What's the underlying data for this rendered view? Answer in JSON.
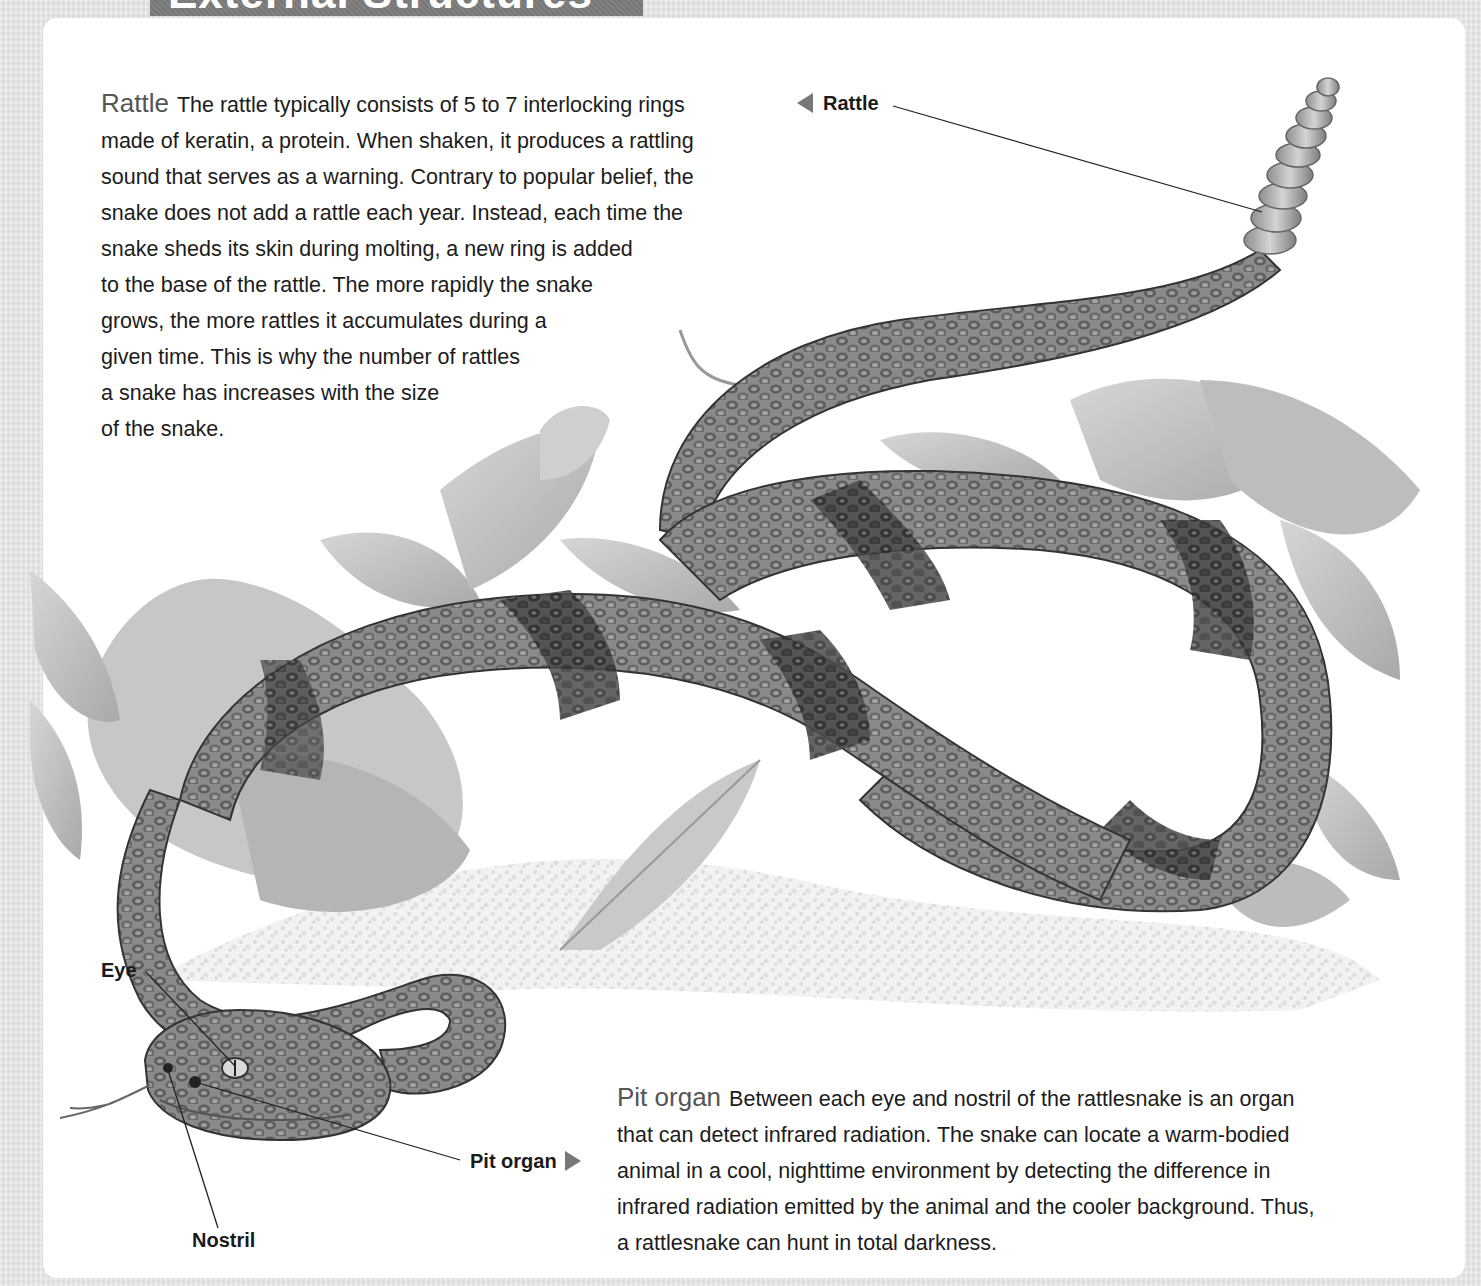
{
  "header": {
    "title": "External Structures",
    "title_tab_color": "#7b7b7b"
  },
  "sections": {
    "rattle": {
      "heading": "Rattle",
      "lines": [
        "The rattle typically consists of 5 to 7 interlocking rings",
        "made of keratin, a protein. When shaken, it produces a rattling",
        "sound that serves as a warning. Contrary to popular belief, the",
        "snake does not add a rattle each year. Instead, each time the",
        "snake sheds its skin during molting, a new ring is added",
        "to the base of the rattle. The more rapidly the snake",
        "grows, the more rattles it accumulates during a",
        "given time. This is why the number of rattles",
        "a snake has increases with the size",
        "of the snake."
      ]
    },
    "pit_organ": {
      "heading": "Pit organ",
      "lines": [
        "Between each eye and nostril of the rattlesnake is an organ",
        "that can detect infrared radiation. The snake can locate a warm-bodied",
        "animal in a cool, nighttime environment by detecting the difference in",
        "infrared radiation emitted by the animal and the cooler background. Thus,",
        "a rattlesnake can hunt in total darkness."
      ]
    }
  },
  "callouts": {
    "rattle": "Rattle",
    "eye": "Eye",
    "pit_organ": "Pit organ",
    "nostril": "Nostril"
  },
  "illustration": {
    "subject": "rattlesnake-illustration",
    "style": "grayscale"
  },
  "colors": {
    "panel": "#ffffff",
    "frame": "#e4e4e4",
    "text": "#1c1c1c",
    "heading": "#555555",
    "arrow": "#777777"
  }
}
